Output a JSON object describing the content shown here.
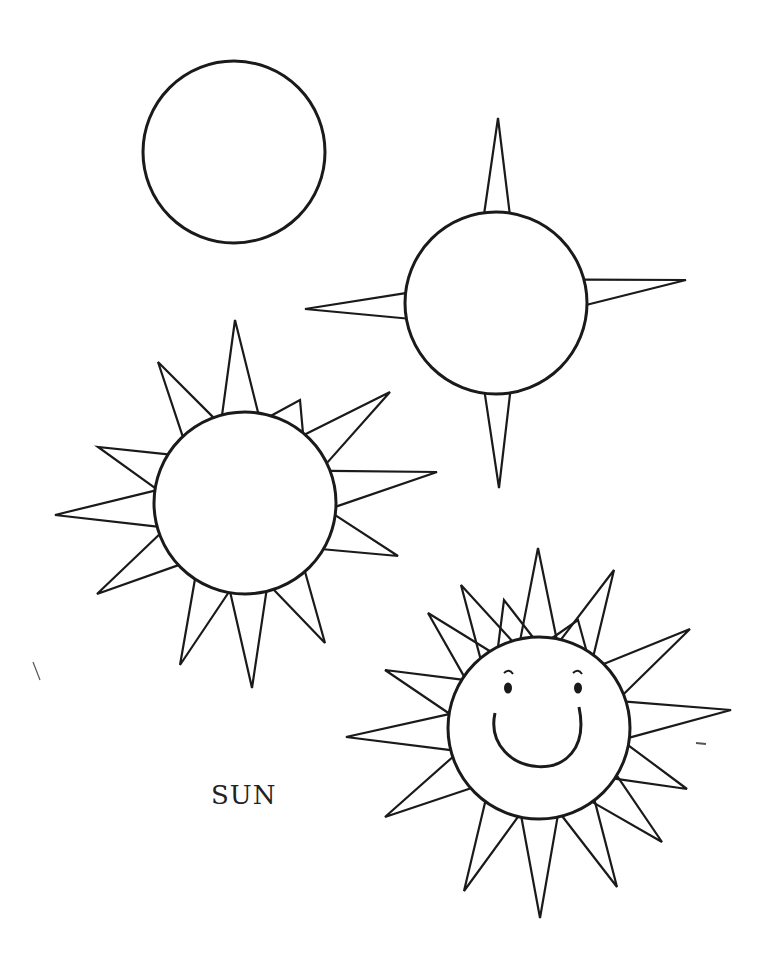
{
  "caption": "SUN",
  "drawing": {
    "title": "How to draw a sun, step by step",
    "stroke_color": "#1a1a1a",
    "background": "#ffffff",
    "steps": [
      {
        "step": 1,
        "label": "circle",
        "center": [
          234,
          152
        ],
        "radius": 91
      },
      {
        "step": 2,
        "label": "circle-with-4-rays",
        "center": [
          496,
          303
        ],
        "radius": 91,
        "rays": [
          [
            498,
            118
          ],
          [
            686,
            280
          ],
          [
            499,
            488
          ],
          [
            305,
            309
          ]
        ]
      },
      {
        "step": 3,
        "label": "circle-with-12-rays",
        "center": [
          245,
          503
        ],
        "radius": 91,
        "rays": [
          [
            235,
            320
          ],
          [
            390,
            392
          ],
          [
            437,
            472
          ],
          [
            398,
            556
          ],
          [
            325,
            643
          ],
          [
            252,
            688
          ],
          [
            180,
            665
          ],
          [
            97,
            594
          ],
          [
            55,
            515
          ],
          [
            98,
            447
          ],
          [
            158,
            362
          ],
          [
            300,
            400
          ]
        ]
      },
      {
        "step": 4,
        "label": "smiling-sun-with-16-rays",
        "center": [
          539,
          728
        ],
        "radius": 91,
        "rays": [
          [
            538,
            548
          ],
          [
            614,
            570
          ],
          [
            690,
            629
          ],
          [
            731,
            710
          ],
          [
            687,
            789
          ],
          [
            662,
            842
          ],
          [
            617,
            887
          ],
          [
            540,
            918
          ],
          [
            464,
            891
          ],
          [
            385,
            817
          ],
          [
            346,
            737
          ],
          [
            385,
            670
          ],
          [
            428,
            613
          ],
          [
            461,
            585
          ],
          [
            504,
            600
          ],
          [
            578,
            620
          ]
        ]
      }
    ]
  }
}
